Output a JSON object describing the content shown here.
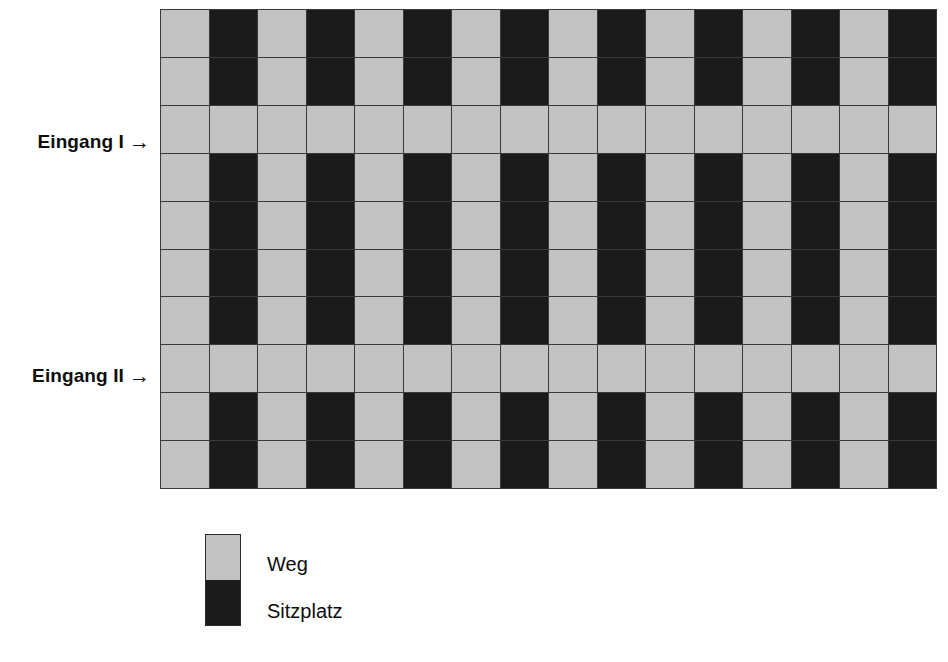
{
  "diagram": {
    "type": "seating-layout-grid",
    "colors": {
      "weg": "#c2c2c2",
      "sitzplatz": "#1b1b1b",
      "gridline": "#3a3a3a",
      "text": "#0d0d0d",
      "background": "#ffffff"
    },
    "grid": {
      "columns": 16,
      "rows": 10,
      "aisle_rows": [
        3,
        8
      ],
      "column_pattern": [
        "weg",
        "sitzplatz",
        "weg",
        "sitzplatz",
        "weg",
        "sitzplatz",
        "weg",
        "sitzplatz",
        "weg",
        "sitzplatz",
        "weg",
        "sitzplatz",
        "weg",
        "sitzplatz",
        "weg",
        "sitzplatz"
      ],
      "cells": [
        [
          "weg",
          "sitzplatz",
          "weg",
          "sitzplatz",
          "weg",
          "sitzplatz",
          "weg",
          "sitzplatz",
          "weg",
          "sitzplatz",
          "weg",
          "sitzplatz",
          "weg",
          "sitzplatz",
          "weg",
          "sitzplatz"
        ],
        [
          "weg",
          "sitzplatz",
          "weg",
          "sitzplatz",
          "weg",
          "sitzplatz",
          "weg",
          "sitzplatz",
          "weg",
          "sitzplatz",
          "weg",
          "sitzplatz",
          "weg",
          "sitzplatz",
          "weg",
          "sitzplatz"
        ],
        [
          "weg",
          "weg",
          "weg",
          "weg",
          "weg",
          "weg",
          "weg",
          "weg",
          "weg",
          "weg",
          "weg",
          "weg",
          "weg",
          "weg",
          "weg",
          "weg"
        ],
        [
          "weg",
          "sitzplatz",
          "weg",
          "sitzplatz",
          "weg",
          "sitzplatz",
          "weg",
          "sitzplatz",
          "weg",
          "sitzplatz",
          "weg",
          "sitzplatz",
          "weg",
          "sitzplatz",
          "weg",
          "sitzplatz"
        ],
        [
          "weg",
          "sitzplatz",
          "weg",
          "sitzplatz",
          "weg",
          "sitzplatz",
          "weg",
          "sitzplatz",
          "weg",
          "sitzplatz",
          "weg",
          "sitzplatz",
          "weg",
          "sitzplatz",
          "weg",
          "sitzplatz"
        ],
        [
          "weg",
          "sitzplatz",
          "weg",
          "sitzplatz",
          "weg",
          "sitzplatz",
          "weg",
          "sitzplatz",
          "weg",
          "sitzplatz",
          "weg",
          "sitzplatz",
          "weg",
          "sitzplatz",
          "weg",
          "sitzplatz"
        ],
        [
          "weg",
          "sitzplatz",
          "weg",
          "sitzplatz",
          "weg",
          "sitzplatz",
          "weg",
          "sitzplatz",
          "weg",
          "sitzplatz",
          "weg",
          "sitzplatz",
          "weg",
          "sitzplatz",
          "weg",
          "sitzplatz"
        ],
        [
          "weg",
          "weg",
          "weg",
          "weg",
          "weg",
          "weg",
          "weg",
          "weg",
          "weg",
          "weg",
          "weg",
          "weg",
          "weg",
          "weg",
          "weg",
          "weg"
        ],
        [
          "weg",
          "sitzplatz",
          "weg",
          "sitzplatz",
          "weg",
          "sitzplatz",
          "weg",
          "sitzplatz",
          "weg",
          "sitzplatz",
          "weg",
          "sitzplatz",
          "weg",
          "sitzplatz",
          "weg",
          "sitzplatz"
        ],
        [
          "weg",
          "sitzplatz",
          "weg",
          "sitzplatz",
          "weg",
          "sitzplatz",
          "weg",
          "sitzplatz",
          "weg",
          "sitzplatz",
          "weg",
          "sitzplatz",
          "weg",
          "sitzplatz",
          "weg",
          "sitzplatz"
        ]
      ]
    },
    "entrances": [
      {
        "id": "eingang-1",
        "label": "Eingang I",
        "arrow": "→",
        "row": 3
      },
      {
        "id": "eingang-2",
        "label": "Eingang II",
        "arrow": "→",
        "row": 8
      }
    ],
    "legend": {
      "items": [
        {
          "key": "weg",
          "label": "Weg",
          "color": "#c2c2c2"
        },
        {
          "key": "sitzplatz",
          "label": "Sitzplatz",
          "color": "#1b1b1b"
        }
      ]
    }
  }
}
